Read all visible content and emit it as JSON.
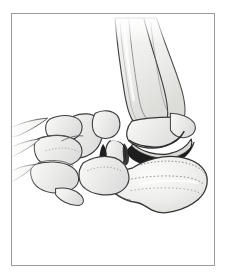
{
  "figure": {
    "domain": "medical-anatomical-illustration",
    "caption": "",
    "style": "stippled pen-and-ink line drawing, grayscale",
    "has_text_labels": false,
    "has_leader_lines": false,
    "frame": {
      "visible": true,
      "left": 11,
      "top": 13,
      "width": 204,
      "height": 253,
      "border_width": 1,
      "border_color": "#9a9a9a",
      "fill_color": "#ffffff"
    }
  },
  "palette": {
    "page_background": "#ffffff",
    "frame_border": "#9a9a9a",
    "bone_fill_light": "#f2f2f0",
    "bone_fill_mid": "#e6e6e3",
    "bone_fill_shadow": "#d4d4d1",
    "outline_dark": "#3a3a3a",
    "outline_mid": "#5e5e5e",
    "outline_soft": "#8c8c8c",
    "fracture_black": "#1a1a1a",
    "stipple_dot": "#9d9d9a",
    "highlight_white": "#fdfdfd"
  },
  "anatomy": {
    "view": "lateral oblique",
    "structures": [
      {
        "id": "tibia",
        "label": "Tibia",
        "region": "leg",
        "position": "upper-center-right",
        "fractured": false
      },
      {
        "id": "fibula",
        "label": "Fibula",
        "region": "leg",
        "position": "upper-right",
        "fractured": false
      },
      {
        "id": "lateral-malleolus",
        "label": "Lateral malleolus",
        "region": "ankle",
        "position": "right",
        "fractured": false
      },
      {
        "id": "talus-body",
        "label": "Talus (body)",
        "region": "hindfoot",
        "position": "center",
        "fractured": true
      },
      {
        "id": "talus-head",
        "label": "Talus (head / neck)",
        "region": "hindfoot",
        "position": "center-left",
        "fractured": true
      },
      {
        "id": "calcaneus",
        "label": "Calcaneus",
        "region": "hindfoot",
        "position": "lower-right",
        "fractured": false
      },
      {
        "id": "navicular",
        "label": "Navicular",
        "region": "midfoot",
        "position": "center-left",
        "fractured": false
      },
      {
        "id": "cuboid",
        "label": "Cuboid",
        "region": "midfoot",
        "position": "lower-center",
        "fractured": false
      },
      {
        "id": "cuneiforms",
        "label": "Cuneiforms",
        "region": "midfoot",
        "position": "left",
        "fractured": false
      },
      {
        "id": "metatarsals",
        "label": "Metatarsal bases and shafts",
        "region": "forefoot",
        "position": "far-left",
        "fractured": false
      }
    ],
    "findings": [
      {
        "id": "talar-neck-fracture",
        "label": "Talar neck fracture with dark displaced fracture line"
      },
      {
        "id": "subtalar-dislocation",
        "label": "Subtalar joint disruption shown as heavy black gap"
      },
      {
        "id": "ankle-joint-space",
        "label": "Tibiotalar joint space darkened and widened"
      }
    ]
  }
}
